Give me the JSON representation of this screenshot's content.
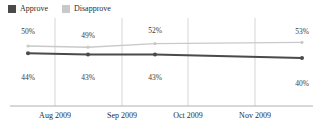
{
  "legend": {
    "items": [
      {
        "label": "Approve",
        "color": "#4a4a4a",
        "icon": "square-swatch"
      },
      {
        "label": "Disapprove",
        "color": "#c9c9c9",
        "icon": "square-swatch"
      }
    ]
  },
  "axis": {
    "ticks": [
      {
        "label": "Aug 2009",
        "x": 55
      },
      {
        "label": "Sep 2009",
        "x": 122
      },
      {
        "label": "Oct 2009",
        "x": 188
      },
      {
        "label": "Nov 2009",
        "x": 255
      }
    ],
    "baseline_color": "#b0b0b0",
    "gridline_color": "#d6d6d6"
  },
  "labels": {
    "approve": [
      {
        "text": "44%",
        "x": 28,
        "y": 56
      },
      {
        "text": "43%",
        "x": 88,
        "y": 56
      },
      {
        "text": "43%",
        "x": 155,
        "y": 56
      },
      {
        "text": "40%",
        "x": 302,
        "y": 62
      }
    ],
    "disapprove": [
      {
        "text": "50%",
        "x": 28,
        "y": 10
      },
      {
        "text": "49%",
        "x": 88,
        "y": 14
      },
      {
        "text": "52%",
        "x": 155,
        "y": 9
      },
      {
        "text": "53%",
        "x": 302,
        "y": 10
      }
    ]
  },
  "chart_data": {
    "type": "line",
    "title": "",
    "subtitle": "",
    "xlabel": "",
    "ylabel": "",
    "categories": [
      "Aug 2009",
      "Sep 2009",
      "Oct 2009",
      "Nov 2009"
    ],
    "series": [
      {
        "name": "Approve",
        "color": "#4a4a4a",
        "values": [
          44,
          43,
          43,
          40
        ],
        "point_labels": [
          "44%",
          "43%",
          "43%",
          "40%"
        ],
        "label_position": "below"
      },
      {
        "name": "Disapprove",
        "color": "#c9c9c9",
        "values": [
          50,
          49,
          52,
          53
        ],
        "point_labels": [
          "50%",
          "49%",
          "52%",
          "53%"
        ],
        "label_position": "above"
      }
    ],
    "ylim": [
      0,
      60
    ],
    "grid": "vertical-only",
    "legend_position": "top-left",
    "markers": true
  }
}
